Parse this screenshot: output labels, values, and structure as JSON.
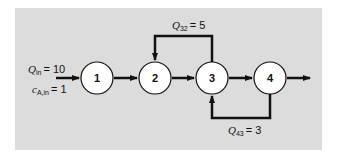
{
  "diagram": {
    "background": "#dcdcdc",
    "nodes": [
      {
        "id": "1",
        "label": "1"
      },
      {
        "id": "2",
        "label": "2"
      },
      {
        "id": "3",
        "label": "3"
      },
      {
        "id": "4",
        "label": "4"
      }
    ],
    "inflow": {
      "q_symbol": "Q",
      "q_sub": "in",
      "q_value": "= 10",
      "c_symbol": "c",
      "c_sub": "A,in",
      "c_value": "= 1"
    },
    "recycle_top": {
      "symbol": "Q",
      "sub": "32",
      "value": "= 5"
    },
    "recycle_bottom": {
      "symbol": "Q",
      "sub": "43",
      "value": "= 3"
    }
  }
}
